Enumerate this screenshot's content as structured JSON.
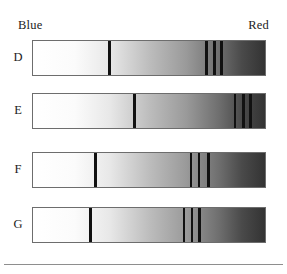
{
  "figure": {
    "axis_labels": {
      "left_end": "Blue",
      "right_end": "Red"
    },
    "bottom_rule": true
  },
  "chart_data": {
    "type": "heatmap",
    "xlabel": "Wavelength (Blue → Red)",
    "ylabel": "",
    "grid": false,
    "legend": "none",
    "axis_range_labels": [
      "Blue",
      "Red"
    ],
    "bar_geometry": {
      "left_px": 32,
      "right_px": 266,
      "width_px": 234,
      "height_px": 36
    },
    "gradient": {
      "description": "continuous grayscale ramp, white at Blue end to near-black at Red end",
      "stops": [
        {
          "pos": 0.0,
          "color": "#ffffff"
        },
        {
          "pos": 0.18,
          "color": "#fbfbfb"
        },
        {
          "pos": 0.33,
          "color": "#e8e8e8"
        },
        {
          "pos": 0.5,
          "color": "#bdbdbd"
        },
        {
          "pos": 0.66,
          "color": "#9a9a9a"
        },
        {
          "pos": 0.8,
          "color": "#6f6f6f"
        },
        {
          "pos": 0.9,
          "color": "#4a4a4a"
        },
        {
          "pos": 1.0,
          "color": "#333333"
        }
      ]
    },
    "band_color": "#111111",
    "series": [
      {
        "name": "D",
        "label": "D",
        "top_px": 40,
        "bands_frac": [
          0.325,
          0.742,
          0.778,
          0.808
        ],
        "band_widths_frac": [
          0.013,
          0.011,
          0.011,
          0.013
        ],
        "band_count": 4
      },
      {
        "name": "E",
        "label": "E",
        "top_px": 93,
        "bands_frac": [
          0.432,
          0.866,
          0.902,
          0.932
        ],
        "band_widths_frac": [
          0.013,
          0.011,
          0.011,
          0.013
        ],
        "band_count": 4
      },
      {
        "name": "F",
        "label": "F",
        "top_px": 152,
        "bands_frac": [
          0.261,
          0.675,
          0.711,
          0.748
        ],
        "band_widths_frac": [
          0.013,
          0.011,
          0.011,
          0.013
        ],
        "band_count": 4
      },
      {
        "name": "G",
        "label": "G",
        "top_px": 207,
        "bands_frac": [
          0.24,
          0.645,
          0.68,
          0.71
        ],
        "band_widths_frac": [
          0.013,
          0.011,
          0.011,
          0.013
        ],
        "band_count": 4
      }
    ]
  }
}
